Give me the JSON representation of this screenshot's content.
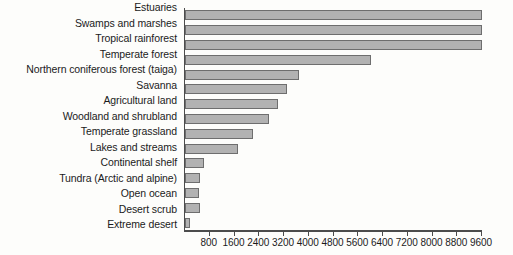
{
  "chart_data": {
    "type": "bar",
    "orientation": "horizontal",
    "title": "",
    "xlabel": "",
    "ylabel": "",
    "xlim": [
      0,
      9600
    ],
    "grid": false,
    "legend": null,
    "bar_color": "#b2b2b2",
    "bar_edge_color": "#6e6e6e",
    "axis_color": "#4c4c4c",
    "xticks": [
      800,
      1600,
      2400,
      3200,
      4000,
      4800,
      5600,
      6400,
      7200,
      8000,
      8800,
      9600
    ],
    "xticklabels": [
      "800",
      "1600",
      "2400",
      "3200",
      "4000",
      "4800",
      "5600",
      "6400",
      "7200",
      "8000",
      "8800",
      "9600"
    ],
    "categories": [
      "Estuaries",
      "Swamps and marshes",
      "Tropical rainforest",
      "Temperate forest",
      "Northern coniferous forest (taiga)",
      "Savanna",
      "Agricultural land",
      "Woodland and shrubland",
      "Temperate grassland",
      "Lakes and streams",
      "Continental shelf",
      "Tundra (Arctic and alpine)",
      "Open ocean",
      "Desert scrub",
      "Extreme desert"
    ],
    "values": [
      9600,
      9600,
      9600,
      6000,
      3700,
      3300,
      3000,
      2700,
      2200,
      1700,
      600,
      500,
      450,
      500,
      150
    ]
  }
}
